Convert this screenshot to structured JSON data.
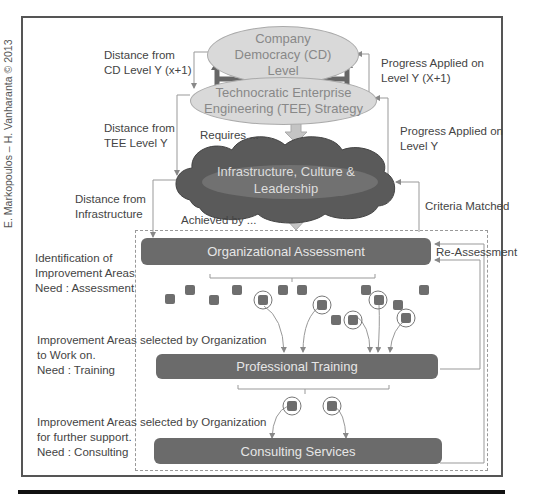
{
  "copyright": "E. Markopoulos – H. Vanharanta © 2013",
  "nodes": {
    "company_democracy": "Company\nDemocracy (CD)\nLevel",
    "tee_strategy": "Technocratic Enterprise\nEngineering (TEE) Strategy",
    "infrastructure": "Infrastructure, Culture &\nLeadership",
    "organizational_assessment": "Organizational Assessment",
    "professional_training": "Professional Training",
    "consulting_services": "Consulting Services"
  },
  "edge_labels": {
    "distance_cd": "Distance from\nCD Level Y (x+1)",
    "distance_tee": "Distance from\nTEE Level Y",
    "distance_infra": "Distance from\nInfrastructure",
    "progress_cd": "Progress Applied on\nLevel Y (X+1)",
    "progress_tee": "Progress Applied on\nLevel Y",
    "requires": "Requires ...",
    "achieved_by": "Achieved by ...",
    "criteria_matched": "Criteria Matched",
    "re_assessment": "Re-Assessment"
  },
  "side_notes": {
    "assessment": "Identification of\nImprovement Areas\nNeed : Assessment",
    "training": "Improvement Areas selected by Organization\nto Work on.\nNeed : Training",
    "consulting": "Improvement Areas selected by Organization\nfor further support.\nNeed : Consulting"
  },
  "colors": {
    "bar": "#6b6b6b",
    "ellipse": "#d9d9d9",
    "cloud": "#555555",
    "square": "#6e6e6e",
    "line": "#999999"
  }
}
